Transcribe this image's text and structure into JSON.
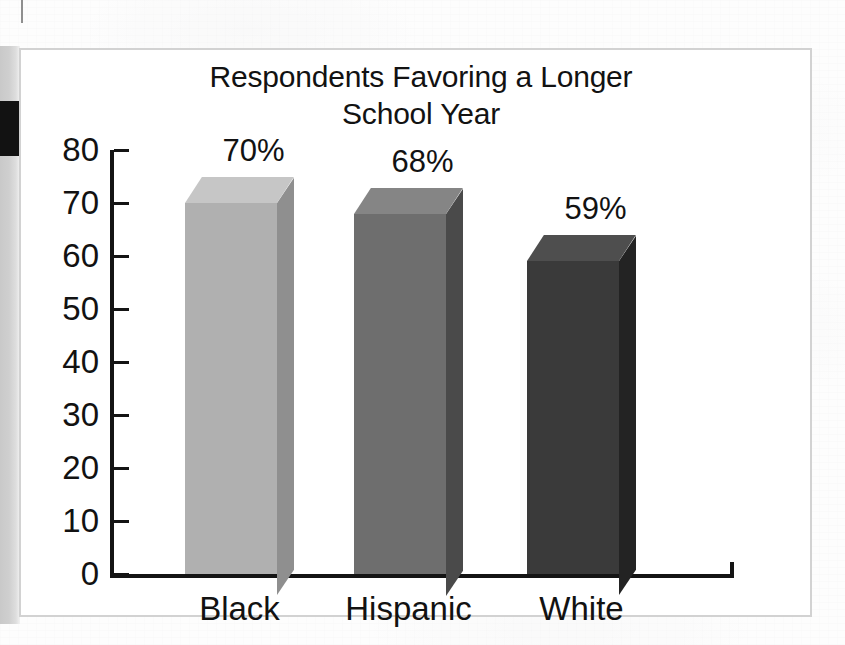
{
  "figure": {
    "title_line_1": "Respondents Favoring a Longer",
    "title_line_2": "School Year",
    "title_full": "Respondents Favoring a Longer\nSchool Year"
  },
  "chart_data": {
    "type": "bar",
    "title": "Respondents Favoring a Longer School Year",
    "subtitle": "",
    "xlabel": "",
    "ylabel": "",
    "categories": [
      "Black",
      "Hispanic",
      "White"
    ],
    "values": [
      70,
      68,
      59
    ],
    "data_labels": [
      "70%",
      "68%",
      "59%"
    ],
    "ylim": [
      0,
      80
    ],
    "ytick_labels": [
      "80",
      "70",
      "60",
      "50",
      "40",
      "30",
      "20",
      "10",
      "0"
    ],
    "ytick_values": [
      80,
      70,
      60,
      50,
      40,
      30,
      20,
      10,
      0
    ],
    "grid": false,
    "legend": "none",
    "style": "3d-column",
    "series": [
      {
        "name": "Percent favoring a longer school year",
        "values": [
          70,
          68,
          59
        ]
      }
    ],
    "bar_colors": [
      "#b0b0b0",
      "#6e6e6e",
      "#3a3a3a"
    ],
    "bar_top_colors": [
      "#c6c6c6",
      "#858585",
      "#4e4e4e"
    ],
    "bar_side_colors": [
      "#8f8f8f",
      "#4a4a4a",
      "#232323"
    ],
    "axis_color": "#141414",
    "panel_border_color": "#d2d2d2",
    "background_color": "#ffffff"
  },
  "scan": {
    "gutter_shadow_color": "#c9c9c9",
    "artifact_block_color": "#121212"
  }
}
